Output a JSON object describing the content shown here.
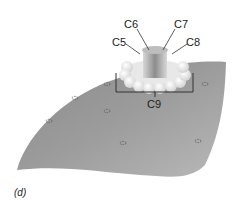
{
  "diagram": {
    "panel_label": "(d)",
    "labels": {
      "c5": "C5",
      "c6": "C6",
      "c7": "C7",
      "c8": "C8",
      "c9": "C9"
    },
    "colors": {
      "membrane_dark": "#7a7a7a",
      "membrane_light": "#b5b5b5",
      "pore_light": "#f2f2f2",
      "pore_core": "#9a9a9a",
      "leader_line": "#333333"
    },
    "membrane_marks_count": 8
  }
}
